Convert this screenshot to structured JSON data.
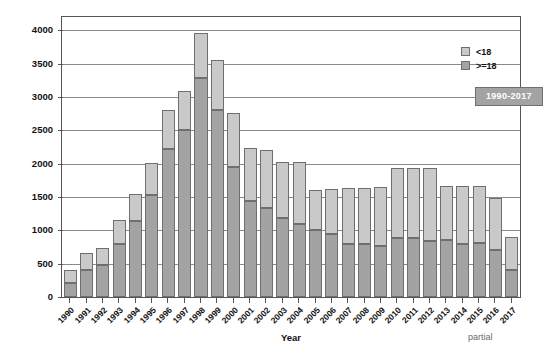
{
  "chart_data": {
    "type": "bar",
    "title": "",
    "subtitle": "",
    "xlabel": "Year",
    "ylabel": "AUTO-HSCT",
    "ylim": [
      0,
      4200
    ],
    "yticks": [
      0,
      500,
      1000,
      1500,
      2000,
      2500,
      3000,
      3500,
      4000
    ],
    "grid": true,
    "stacked": true,
    "legend_position": "top-right",
    "annotations": [
      "1990-2017",
      "partial"
    ],
    "categories": [
      "1990",
      "1991",
      "1992",
      "1993",
      "1994",
      "1995",
      "1996",
      "1997",
      "1998",
      "1999",
      "2000",
      "2001",
      "2002",
      "2003",
      "2004",
      "2005",
      "2006",
      "2007",
      "2008",
      "2009",
      "2010",
      "2011",
      "2012",
      "2013",
      "2014",
      "2015",
      "2016",
      "2017"
    ],
    "series": [
      {
        "name": ">=18",
        "color": "#a3a3a3",
        "values": [
          210,
          410,
          480,
          790,
          1140,
          1530,
          2220,
          2510,
          3290,
          2800,
          1950,
          1440,
          1340,
          1190,
          1090,
          1010,
          950,
          790,
          800,
          760,
          880,
          880,
          840,
          860,
          790,
          810,
          700,
          400
        ]
      },
      {
        "name": "<18",
        "color": "#c9c9c9",
        "values": [
          195,
          245,
          255,
          370,
          400,
          485,
          580,
          580,
          670,
          750,
          810,
          790,
          870,
          830,
          930,
          600,
          670,
          840,
          840,
          890,
          1050,
          1050,
          1100,
          800,
          870,
          850,
          780,
          500
        ]
      }
    ],
    "totals": [
      405,
      655,
      735,
      1160,
      1540,
      2015,
      2800,
      3090,
      3960,
      3550,
      2760,
      2230,
      2210,
      2020,
      2020,
      1610,
      1620,
      1630,
      1640,
      1650,
      1930,
      1930,
      1940,
      1660,
      1660,
      1660,
      1480,
      900
    ]
  },
  "legend": {
    "items": [
      {
        "label": "<18"
      },
      {
        "label": ">=18"
      }
    ]
  },
  "badge": {
    "label": "1990-2017"
  },
  "axes": {
    "y_title": "AUTO-HSCT",
    "x_title": "Year"
  },
  "footnote": {
    "partial": "partial"
  }
}
